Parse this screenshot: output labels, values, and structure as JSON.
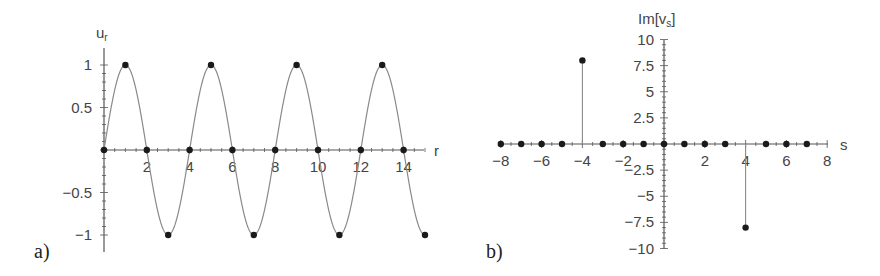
{
  "chart_data": [
    {
      "panel": "a)",
      "type": "line",
      "title": "",
      "xlabel": "r",
      "ylabel": "u",
      "ylabel_subscript": "r",
      "xlim": [
        0,
        15
      ],
      "ylim": [
        -1.1,
        1.1
      ],
      "xticks": [
        2,
        4,
        6,
        8,
        10,
        12,
        14
      ],
      "yticks": [
        1,
        0.5,
        -0.5,
        -1
      ],
      "ytick_labels": [
        "1",
        "0.5",
        "−0.5",
        "−1"
      ],
      "grid": false,
      "curve": {
        "function": "sin(pi*r/2)",
        "r_start": 0,
        "r_end": 15
      },
      "points": {
        "x": [
          0,
          1,
          2,
          3,
          4,
          5,
          6,
          7,
          8,
          9,
          10,
          11,
          12,
          13,
          14,
          15
        ],
        "y": [
          0,
          1,
          0,
          -1,
          0,
          1,
          0,
          -1,
          0,
          1,
          0,
          -1,
          0,
          1,
          0,
          -1
        ]
      }
    },
    {
      "panel": "b)",
      "type": "scatter",
      "style": "stem",
      "title": "",
      "xlabel": "s",
      "ylabel": "Im[v",
      "ylabel_subscript": "s",
      "ylabel_suffix": "]",
      "xlim": [
        -8,
        8
      ],
      "ylim": [
        -10,
        10
      ],
      "xticks": [
        -8,
        -6,
        -4,
        -2,
        2,
        4,
        6,
        8
      ],
      "xtick_labels": [
        "−8",
        "−6",
        "−4",
        "−2",
        "2",
        "4",
        "6",
        "8"
      ],
      "yticks": [
        10,
        7.5,
        5,
        2.5,
        -2.5,
        -5,
        -7.5,
        -10
      ],
      "ytick_labels": [
        "10",
        "7.5",
        "5",
        "2.5",
        "−2.5",
        "−5",
        "−7.5",
        "−10"
      ],
      "grid": false,
      "points": {
        "x": [
          -8,
          -7,
          -6,
          -5,
          -4,
          -3,
          -2,
          -1,
          0,
          1,
          2,
          3,
          4,
          5,
          6,
          7
        ],
        "y": [
          0,
          0,
          0,
          0,
          8,
          0,
          0,
          0,
          0,
          0,
          0,
          0,
          -8,
          0,
          0,
          0
        ]
      }
    }
  ],
  "colors": {
    "curve": "#8a8a8a",
    "axis": "#555555",
    "marker": "#1a1a1a"
  }
}
